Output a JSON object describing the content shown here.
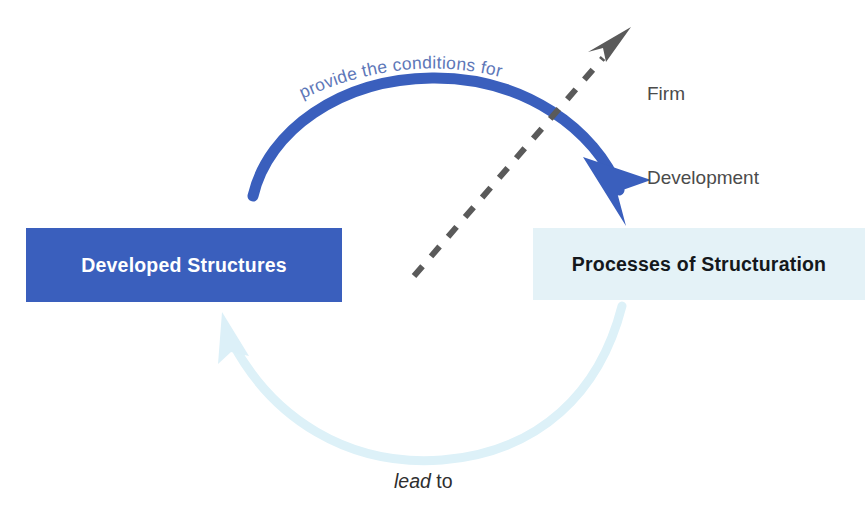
{
  "diagram": {
    "background_color": "#ffffff",
    "nodes": [
      {
        "id": "developed-structures",
        "label": "Developed Structures",
        "fill": "#3a5fbd",
        "text_color": "#ffffff",
        "x": 26,
        "y": 228,
        "width": 316,
        "height": 74
      },
      {
        "id": "processes-of-structuration",
        "label": "Processes of Structuration",
        "fill": "#e4f2f7",
        "text_color": "#14181c",
        "x": 533,
        "y": 228,
        "width": 332,
        "height": 72
      }
    ],
    "edges": [
      {
        "id": "top-arc",
        "label": "provide the conditions for",
        "from": "developed-structures",
        "to": "processes-of-structuration",
        "color": "#3a5fbd",
        "label_color": "#5d77b8",
        "style": "solid-curved",
        "direction": "left-to-right"
      },
      {
        "id": "bottom-arc",
        "label": "lead to",
        "from": "processes-of-structuration",
        "to": "developed-structures",
        "color": "#dcf0f7",
        "label_color": "#2e2e2e",
        "style": "solid-curved-faded",
        "direction": "right-to-left"
      },
      {
        "id": "development-vector",
        "label": "Firm\nDevelopment",
        "color": "#5a5a5a",
        "style": "dashed",
        "direction": "lower-left-to-upper-right"
      }
    ],
    "labels": {
      "arc_top": "provide the conditions for",
      "arc_bottom_lead": "lead",
      "arc_bottom_to": " to",
      "firm_line1": "Firm",
      "firm_line2": "Development"
    }
  }
}
